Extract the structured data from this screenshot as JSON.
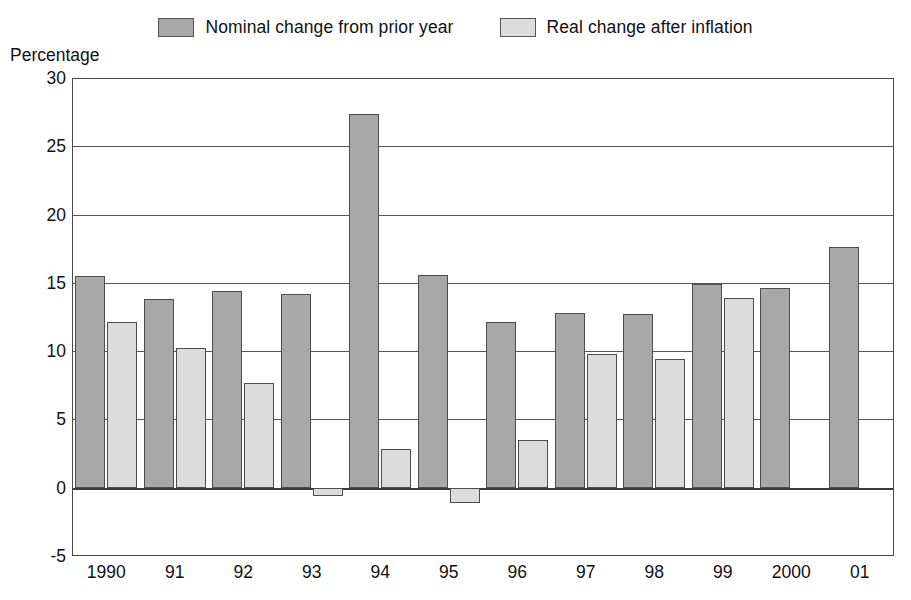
{
  "chart_data": {
    "type": "bar",
    "title": "",
    "subtitle": "",
    "xlabel": "",
    "ylabel": "Percentage",
    "ylim": [
      -5,
      30
    ],
    "ytick_values": [
      30,
      25,
      20,
      15,
      10,
      5,
      0,
      -5
    ],
    "ytick_labels": [
      "30",
      "25",
      "20",
      "15",
      "10",
      "5",
      "0",
      "-5"
    ],
    "grid": true,
    "legend_position": "top-center",
    "categories": [
      "1990",
      "91",
      "92",
      "93",
      "94",
      "95",
      "96",
      "97",
      "98",
      "99",
      "2000",
      "01"
    ],
    "series": [
      {
        "name": "Nominal change from prior year",
        "color": "#a8a8a8",
        "values": [
          15.5,
          13.8,
          14.4,
          14.2,
          27.4,
          15.6,
          12.1,
          12.8,
          12.7,
          14.9,
          14.6,
          17.6
        ]
      },
      {
        "name": "Real change after inflation",
        "color": "#dcdcdc",
        "values": [
          12.1,
          10.2,
          7.7,
          -0.6,
          2.8,
          -1.1,
          3.5,
          9.8,
          9.4,
          13.9,
          null,
          null
        ]
      }
    ]
  },
  "legend": {
    "entries": [
      {
        "label": "Nominal change from prior year",
        "swatch": "#a8a8a8"
      },
      {
        "label": "Real change after inflation",
        "swatch": "#dcdcdc"
      }
    ]
  },
  "axis": {
    "y_title": "Percentage"
  },
  "colors": {
    "nominal": "#a8a8a8",
    "real": "#dcdcdc",
    "frame": "#4a4a4a",
    "grid": "#555555",
    "text": "#111111",
    "background": "#ffffff"
  }
}
